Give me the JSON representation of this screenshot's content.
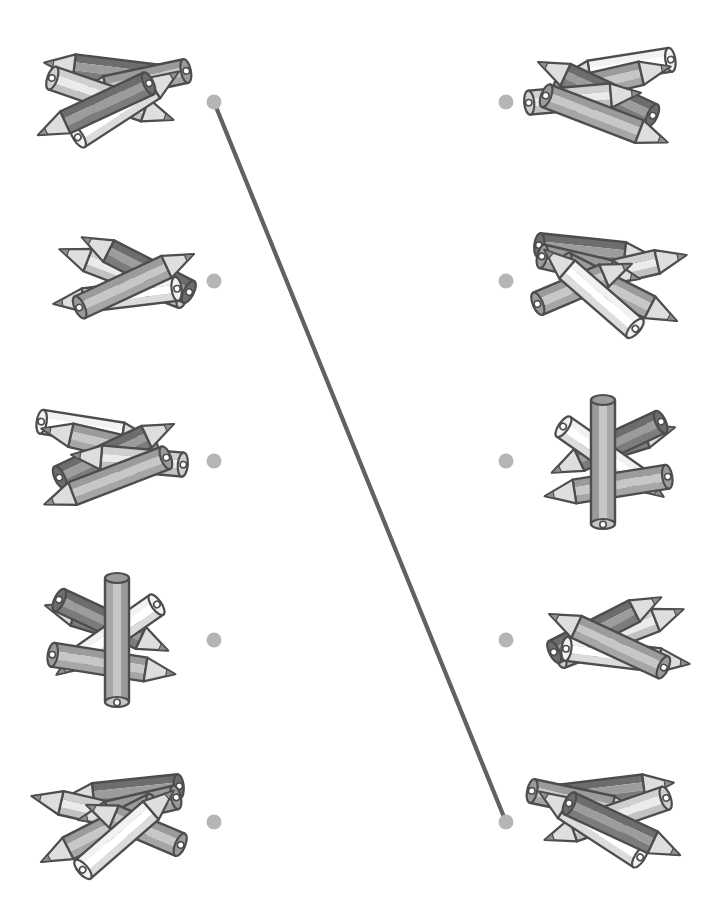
{
  "worksheet": {
    "kind": "match-the-equal-groups",
    "canvas": {
      "width": 713,
      "height": 908
    },
    "rows_y": [
      102,
      281,
      461,
      640,
      822
    ],
    "dots": {
      "left_x": 214,
      "right_x": 506,
      "radius": 7.5
    },
    "clusters_left": [
      {
        "id": "L1",
        "row": 1,
        "pencil_count": 5,
        "cx": 112,
        "cy": 100,
        "pencils": [
          {
            "dx": -8,
            "dy": -30,
            "r": 7,
            "shade": "dark",
            "flip": true,
            "len": 120
          },
          {
            "dx": 22,
            "dy": -18,
            "r": -12,
            "shade": "mid",
            "flip": true,
            "len": 118
          },
          {
            "dx": -2,
            "dy": -2,
            "r": 19,
            "shade": "light",
            "flip": false,
            "len": 134
          },
          {
            "dx": 14,
            "dy": 6,
            "r": -33,
            "shade": "white",
            "flip": false,
            "len": 126
          },
          {
            "dx": -16,
            "dy": 8,
            "r": -25,
            "shade": "dark",
            "flip": true,
            "len": 128
          }
        ]
      },
      {
        "id": "L2",
        "row": 2,
        "pencil_count": 4,
        "cx": 128,
        "cy": 280,
        "pencils": [
          {
            "dx": -4,
            "dy": -6,
            "r": 21,
            "shade": "light",
            "flip": true,
            "len": 138
          },
          {
            "dx": 10,
            "dy": -14,
            "r": 27,
            "shade": "dark",
            "flip": true,
            "len": 126
          },
          {
            "dx": -10,
            "dy": 16,
            "r": -7,
            "shade": "white",
            "flip": true,
            "len": 130
          },
          {
            "dx": 6,
            "dy": 2,
            "r": -25,
            "shade": "mid",
            "flip": false,
            "len": 132
          }
        ]
      },
      {
        "id": "L3",
        "row": 3,
        "pencil_count": 5,
        "cx": 112,
        "cy": 462,
        "pencils": [
          {
            "dx": -18,
            "dy": -32,
            "r": 9,
            "shade": "white",
            "flip": false,
            "len": 118
          },
          {
            "dx": -12,
            "dy": -20,
            "r": 13,
            "shade": "mid",
            "flip": true,
            "len": 120
          },
          {
            "dx": 2,
            "dy": -10,
            "r": -25,
            "shade": "dark",
            "flip": false,
            "len": 132
          },
          {
            "dx": 18,
            "dy": -2,
            "r": 5,
            "shade": "light",
            "flip": true,
            "len": 118
          },
          {
            "dx": -4,
            "dy": 18,
            "r": -21,
            "shade": "mid",
            "flip": true,
            "len": 136
          }
        ]
      },
      {
        "id": "L4",
        "row": 4,
        "pencil_count": 5,
        "cx": 113,
        "cy": 640,
        "pencils": [
          {
            "dx": -20,
            "dy": -20,
            "r": 17,
            "shade": "dark",
            "flip": true,
            "len": 100
          },
          {
            "dx": -2,
            "dy": -16,
            "r": 25,
            "shade": "dark",
            "flip": false,
            "len": 126
          },
          {
            "dx": -4,
            "dy": -2,
            "r": -35,
            "shade": "white",
            "flip": true,
            "len": 128
          },
          {
            "dx": -2,
            "dy": 24,
            "r": 9,
            "shade": "mid",
            "flip": false,
            "len": 130
          },
          {
            "dx": 4,
            "dy": 0,
            "r": 90,
            "shade": "mid",
            "flip": false,
            "len": 136,
            "notip": true
          }
        ]
      },
      {
        "id": "L5",
        "row": 5,
        "pencil_count": 6,
        "cx": 112,
        "cy": 822,
        "pencils": [
          {
            "dx": 12,
            "dy": -30,
            "r": -6,
            "shade": "dark",
            "flip": true,
            "len": 122
          },
          {
            "dx": -20,
            "dy": -12,
            "r": 13,
            "shade": "light",
            "flip": true,
            "len": 124
          },
          {
            "dx": 18,
            "dy": -14,
            "r": -13,
            "shade": "mid",
            "flip": true,
            "len": 106
          },
          {
            "dx": -12,
            "dy": 10,
            "r": -27,
            "shade": "mid",
            "flip": true,
            "len": 132
          },
          {
            "dx": 24,
            "dy": 4,
            "r": 23,
            "shade": "mid",
            "flip": true,
            "len": 108
          },
          {
            "dx": 14,
            "dy": 10,
            "r": -41,
            "shade": "white",
            "flip": false,
            "len": 126
          }
        ]
      }
    ],
    "clusters_right": [
      {
        "id": "R1",
        "row": 1,
        "pencil_count": 5,
        "cx": 600,
        "cy": 100,
        "mirror_of": "L3"
      },
      {
        "id": "R2",
        "row": 2,
        "pencil_count": 6,
        "cx": 606,
        "cy": 281,
        "mirror_of": "L5"
      },
      {
        "id": "R3",
        "row": 3,
        "pencil_count": 5,
        "cx": 607,
        "cy": 462,
        "mirror_of": "L4"
      },
      {
        "id": "R4",
        "row": 4,
        "pencil_count": 4,
        "cx": 615,
        "cy": 640,
        "mirror_of": "L2"
      },
      {
        "id": "R5",
        "row": 5,
        "pencil_count": 5,
        "cx": 606,
        "cy": 820,
        "mirror_of": "L1"
      }
    ],
    "connections": [
      {
        "from": {
          "side": "left",
          "row": 1
        },
        "to": {
          "side": "right",
          "row": 5
        }
      }
    ]
  },
  "palette": {
    "background": "#ffffff",
    "outline": "#4d4d4d",
    "dot": "#b5b5b5",
    "line": "#616161",
    "line_width": 4.2,
    "tip_wood": "#dedede",
    "tip_lead": "#8f8f8f",
    "hole": "#ffffff",
    "pencil_shades": {
      "white": {
        "top": "#f2f2f2",
        "face": "#ffffff",
        "bottom": "#dcdcdc"
      },
      "light": {
        "top": "#cfcfcf",
        "face": "#ebebeb",
        "bottom": "#c2c2c2"
      },
      "mid": {
        "top": "#9b9b9b",
        "face": "#c7c7c7",
        "bottom": "#a6a6a6"
      },
      "dark": {
        "top": "#6d6d6d",
        "face": "#9c9c9c",
        "bottom": "#7c7c7c"
      }
    }
  }
}
